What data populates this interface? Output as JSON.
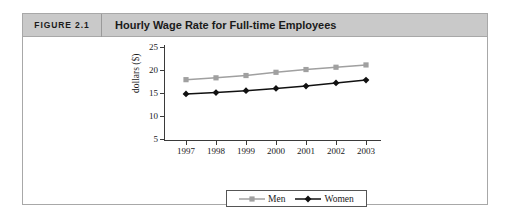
{
  "figure": {
    "label": "FIGURE 2.1",
    "title": "Hourly Wage Rate for Full-time Employees"
  },
  "legend": {
    "items": [
      {
        "name": "Men",
        "marker": "square-marker-icon",
        "color": "#a0a0a0"
      },
      {
        "name": "Women",
        "marker": "diamond-marker-icon",
        "color": "#111111"
      }
    ]
  },
  "chart_data": {
    "type": "line",
    "title": "Hourly Wage Rate for Full-time Employees",
    "xlabel": "",
    "ylabel": "dollars ($)",
    "categories": [
      "1997",
      "1998",
      "1999",
      "2000",
      "2001",
      "2002",
      "2003"
    ],
    "series": [
      {
        "name": "Men",
        "color": "#a0a0a0",
        "marker": "square",
        "values": [
          17.9,
          18.3,
          18.8,
          19.5,
          20.1,
          20.6,
          21.1
        ]
      },
      {
        "name": "Women",
        "color": "#111111",
        "marker": "diamond",
        "values": [
          14.8,
          15.1,
          15.5,
          16.0,
          16.5,
          17.2,
          17.8
        ]
      }
    ],
    "ylim": [
      5,
      25
    ],
    "yticks": [
      5,
      10,
      15,
      20,
      25
    ],
    "grid": false,
    "legend_position": "bottom"
  }
}
